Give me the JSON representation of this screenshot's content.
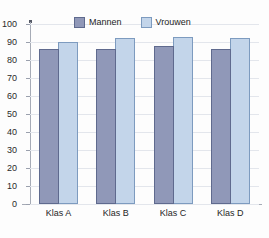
{
  "chart_data": {
    "type": "bar",
    "title": "",
    "subtitle": "",
    "xlabel": "",
    "ylabel": "",
    "categories": [
      "Klas A",
      "Klas B",
      "Klas C",
      "Klas D"
    ],
    "series": [
      {
        "name": "Mannen",
        "color": "#9098b8",
        "values": [
          86,
          86,
          88,
          86
        ]
      },
      {
        "name": "Vrouwen",
        "color": "#c3d5ea",
        "values": [
          90,
          92,
          93,
          92
        ]
      }
    ],
    "ylim": [
      0,
      100
    ],
    "ytick_step": 10,
    "yticks": [
      0,
      10,
      20,
      30,
      40,
      50,
      60,
      70,
      80,
      90,
      100
    ],
    "ytick_labels": [
      "0",
      "10",
      "20",
      "30",
      "40",
      "50",
      "60",
      "70",
      "80",
      "90",
      "100"
    ],
    "grid": true,
    "legend_position": "top-center",
    "grouped": true
  },
  "legend": {
    "items": [
      {
        "label": "Mannen",
        "color": "#9098b8"
      },
      {
        "label": "Vrouwen",
        "color": "#c3d5ea"
      }
    ]
  },
  "colors": {
    "background": "#fdfdfd",
    "gridline": "#e3e6ec",
    "axis": "#a6abb6",
    "text": "#1f1f1f",
    "mannen": "#9098b8",
    "mannen_border": "#5f6a8e",
    "vrouwen": "#c3d5ea",
    "vrouwen_border": "#7d9bbf"
  }
}
